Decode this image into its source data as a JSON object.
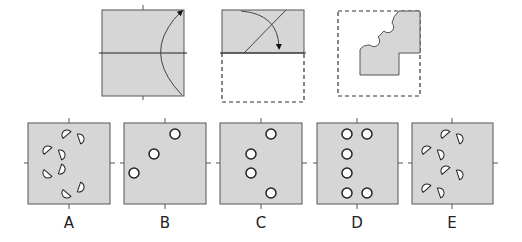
{
  "puzzle": {
    "type": "paper-folding-hole-punch",
    "colors": {
      "paper": "#d6d6d6",
      "border": "#555555",
      "hole_fill": "#ffffff",
      "hole_stroke": "#222222"
    },
    "steps": [
      {
        "index": 1,
        "description": "square folded top-right corner arc arrow along horizontal midline"
      },
      {
        "index": 2,
        "description": "top half shaded, bottom half dashed, diagonal fold line with curved arrow"
      },
      {
        "index": 3,
        "description": "folded shape with semicircle cut-outs along diagonal edge inside dashed square"
      }
    ],
    "options": [
      {
        "label": "A"
      },
      {
        "label": "B"
      },
      {
        "label": "C"
      },
      {
        "label": "D"
      },
      {
        "label": "E"
      }
    ]
  }
}
